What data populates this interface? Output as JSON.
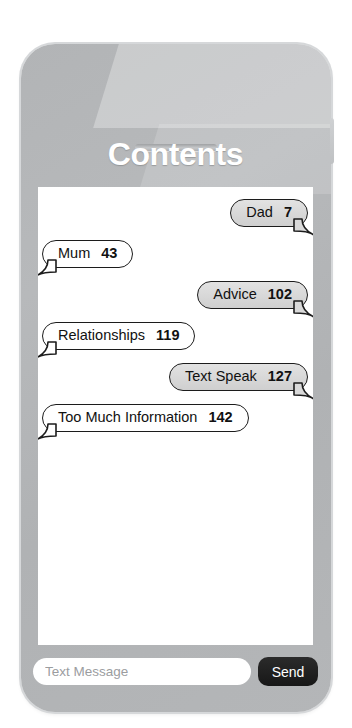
{
  "page": {
    "title": "Contents"
  },
  "device": {
    "body_color": "#b4b6b8",
    "speaker_name": "speaker-slot",
    "side_button_name": "side-button"
  },
  "messages": [
    {
      "align": "right",
      "style": "outgoing",
      "label": "Dad",
      "count": "7"
    },
    {
      "align": "left",
      "style": "incoming",
      "label": "Mum",
      "count": "43"
    },
    {
      "align": "right",
      "style": "outgoing",
      "label": "Advice",
      "count": "102"
    },
    {
      "align": "left",
      "style": "incoming",
      "label": "Relationships",
      "count": "119"
    },
    {
      "align": "right",
      "style": "outgoing",
      "label": "Text Speak",
      "count": "127"
    },
    {
      "align": "left",
      "style": "incoming",
      "label": "Too Much Information",
      "count": "142"
    }
  ],
  "compose": {
    "input_value": "",
    "input_placeholder": "Text Message",
    "send_label": "Send"
  },
  "colors": {
    "bubble_outline": "#1c1c1c",
    "bubble_incoming_fill": "#ffffff",
    "bubble_outgoing_fill": "#d9d9d9",
    "send_button_bg": "#1a1a1a",
    "title_text": "#ffffff",
    "screen_bg": "#ffffff"
  }
}
